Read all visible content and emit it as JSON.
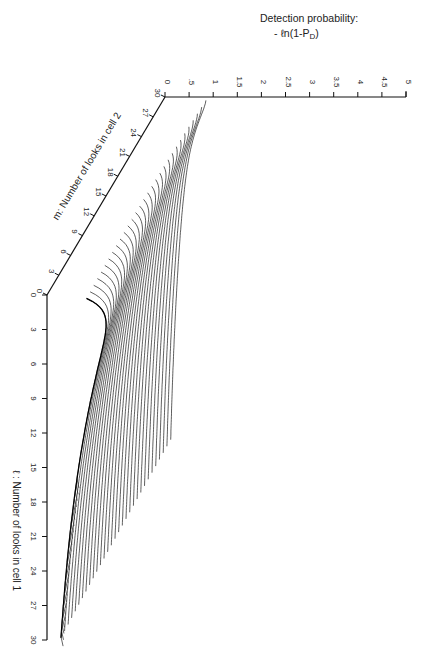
{
  "chart_data": {
    "type": "surface-3d-wireframe",
    "title": "Detection probability:",
    "title_formula": "- ℓn(1-P D)",
    "zlabel": "Detection probability: -ℓn(1-PD)",
    "xlabel": "ℓ : Number of looks in cell 1",
    "ylabel": "m: Number of looks in cell 2",
    "z_ticks": [
      "0",
      ".5",
      "1",
      "1.5",
      "2",
      "2.5",
      "3",
      "3.5",
      "4",
      "4.5",
      "5"
    ],
    "z_range": [
      0,
      5
    ],
    "l_ticks": [
      "0",
      "3",
      "6",
      "9",
      "12",
      "15",
      "18",
      "21",
      "24",
      "27",
      "30"
    ],
    "l_range": [
      0,
      30
    ],
    "m_ticks": [
      "0",
      "3",
      "6",
      "9",
      "12",
      "15",
      "18",
      "21",
      "24",
      "27",
      "30"
    ],
    "m_range": [
      0,
      30
    ],
    "orientation": "rotated 90° (page printed sideways)",
    "surface_description": "Wireframe of -ln(1-PD) over ℓ and m looks; rises from 0 at origin to a peak ≈1.5 near ℓ≈3, m≈0 ridge, then declines along ℓ; curves drawn for each m, hatching on the ℓ-edge",
    "peak_value_approx": 1.5,
    "grid": false,
    "legend": null
  },
  "labels": {
    "title_line1": "Detection probability:",
    "title_line2": "- ℓn(1-P",
    "title_sub": "D",
    "title_close": ")",
    "l_axis": "ℓ : Number of looks in cell 1",
    "m_axis": "m:  Number of looks in cell 2"
  }
}
